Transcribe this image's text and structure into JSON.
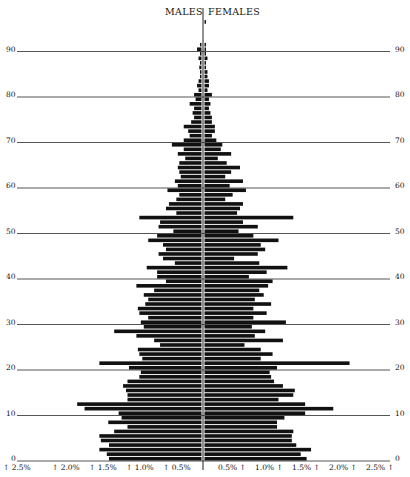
{
  "chart_data": {
    "type": "bar",
    "subtype": "population-pyramid",
    "title": "",
    "header_left": "MALES",
    "header_right": "FEMALES",
    "xlabel": "",
    "ylabel": "",
    "age_axis_ticks": [
      0,
      10,
      20,
      30,
      40,
      50,
      60,
      70,
      80,
      90
    ],
    "x_ticks_left": [
      "↑ 2.5%",
      "↑ 2.0%",
      "↑ 1.5%",
      "↑ 1.0%",
      "↑ 0.5%"
    ],
    "x_ticks_right": [
      "0.5% ↑",
      "1.0% ↑",
      "1.5% ↑",
      "2.0% ↑",
      "2.5% ↑"
    ],
    "xlim": [
      -2.5,
      2.5
    ],
    "ylim": [
      0,
      97
    ],
    "grid": "horizontal lines every 10 years",
    "ages": [
      0,
      1,
      2,
      3,
      4,
      5,
      6,
      7,
      8,
      9,
      10,
      11,
      12,
      13,
      14,
      15,
      16,
      17,
      18,
      19,
      20,
      21,
      22,
      23,
      24,
      25,
      26,
      27,
      28,
      29,
      30,
      31,
      32,
      33,
      34,
      35,
      36,
      37,
      38,
      39,
      40,
      41,
      42,
      43,
      44,
      45,
      46,
      47,
      48,
      49,
      50,
      51,
      52,
      53,
      54,
      55,
      56,
      57,
      58,
      59,
      60,
      61,
      62,
      63,
      64,
      65,
      66,
      67,
      68,
      69,
      70,
      71,
      72,
      73,
      74,
      75,
      76,
      77,
      78,
      79,
      80,
      81,
      82,
      83,
      84,
      85,
      86,
      87,
      88,
      89,
      90,
      91,
      92,
      93,
      94,
      95,
      96
    ],
    "series": [
      {
        "name": "Males",
        "side": "left",
        "values": [
          1.25,
          1.28,
          1.38,
          1.25,
          1.36,
          1.38,
          1.18,
          1.0,
          1.26,
          1.08,
          1.12,
          1.58,
          1.68,
          1.0,
          1.0,
          1.02,
          1.06,
          1.0,
          0.84,
          0.82,
          0.98,
          1.38,
          0.8,
          0.84,
          0.86,
          0.56,
          0.64,
          0.88,
          1.18,
          0.78,
          0.82,
          0.72,
          0.84,
          0.86,
          0.76,
          0.72,
          0.78,
          0.64,
          0.88,
          0.48,
          0.6,
          0.6,
          0.74,
          0.36,
          0.52,
          0.58,
          0.48,
          0.52,
          0.72,
          0.6,
          0.38,
          0.58,
          0.56,
          0.84,
          0.34,
          0.48,
          0.44,
          0.34,
          0.3,
          0.46,
          0.32,
          0.36,
          0.28,
          0.3,
          0.32,
          0.3,
          0.22,
          0.32,
          0.24,
          0.4,
          0.24,
          0.16,
          0.18,
          0.24,
          0.14,
          0.1,
          0.12,
          0.1,
          0.16,
          0.08,
          0.1,
          0.04,
          0.06,
          0.04,
          0.02,
          0.02,
          0.03,
          0.02,
          0.04,
          0.02,
          0.06,
          0.02,
          0,
          0,
          0,
          0,
          0
        ],
        "color": "#111111"
      },
      {
        "name": "Females",
        "side": "right",
        "values": [
          1.38,
          1.3,
          1.44,
          1.24,
          1.18,
          1.18,
          1.2,
          0.98,
          0.98,
          1.08,
          1.36,
          1.74,
          1.36,
          1.0,
          1.2,
          1.22,
          1.06,
          0.94,
          0.9,
          0.88,
          0.98,
          1.96,
          0.76,
          0.92,
          0.76,
          0.54,
          1.06,
          0.68,
          0.82,
          0.64,
          1.1,
          0.66,
          0.84,
          0.66,
          0.9,
          0.68,
          0.8,
          0.74,
          0.86,
          0.92,
          0.6,
          0.84,
          1.12,
          0.74,
          0.4,
          0.72,
          0.82,
          0.76,
          1.0,
          0.66,
          0.46,
          0.72,
          0.52,
          1.2,
          0.44,
          0.48,
          0.52,
          0.28,
          0.38,
          0.56,
          0.34,
          0.52,
          0.28,
          0.36,
          0.48,
          0.3,
          0.18,
          0.36,
          0.22,
          0.24,
          0.16,
          0.1,
          0.14,
          0.14,
          0.1,
          0.1,
          0.08,
          0.06,
          0.08,
          0.06,
          0.1,
          0.04,
          0.06,
          0.06,
          0.04,
          0.04,
          0.02,
          0.02,
          0.04,
          0.02,
          0.02,
          0.02,
          0,
          0,
          0,
          0,
          0.02
        ],
        "color": "#111111"
      }
    ]
  }
}
